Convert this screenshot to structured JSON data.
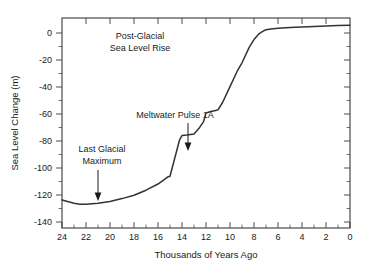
{
  "chart_data": {
    "type": "line",
    "title_line1": "Post-Glacial",
    "title_line2": "Sea Level Rise",
    "xlabel": "Thousands of Years Ago",
    "ylabel": "Sea Level Change (m)",
    "xlim": [
      24,
      0
    ],
    "ylim": [
      -145,
      5
    ],
    "x_ticks": [
      24,
      22,
      20,
      18,
      16,
      14,
      12,
      10,
      8,
      6,
      4,
      2,
      0
    ],
    "x_tick_labels": [
      "24",
      "22",
      "20",
      "18",
      "16",
      "14",
      "12",
      "10",
      "8",
      "6",
      "4",
      "2",
      "0"
    ],
    "y_ticks": [
      0,
      -20,
      -40,
      -60,
      -80,
      -100,
      -120,
      -140
    ],
    "y_tick_labels": [
      "0",
      "-20",
      "-40",
      "-60",
      "-80",
      "-100",
      "-120",
      "-140"
    ],
    "x_axis_reversed": true,
    "grid": false,
    "legend": "none",
    "line_color": "#333333",
    "series": [
      {
        "name": "Sea Level Change",
        "x": [
          24.0,
          23.0,
          22.5,
          22.0,
          21.0,
          20.0,
          19.0,
          18.0,
          17.0,
          16.0,
          15.2,
          15.0,
          14.6,
          14.2,
          14.0,
          13.6,
          13.0,
          12.6,
          12.2,
          12.0,
          11.6,
          11.2,
          11.0,
          10.6,
          10.0,
          9.4,
          9.0,
          8.4,
          8.0,
          7.6,
          7.2,
          7.0,
          6.6,
          6.0,
          5.0,
          4.0,
          3.0,
          2.0,
          1.0,
          0.0
        ],
        "y": [
          -125.0,
          -127.3,
          -128.0,
          -128.0,
          -127.4,
          -126.0,
          -124.0,
          -121.6,
          -118.0,
          -113.6,
          -108.6,
          -108.0,
          -95.0,
          -82.0,
          -79.0,
          -78.6,
          -77.8,
          -74.0,
          -69.0,
          -62.8,
          -61.8,
          -61.0,
          -60.6,
          -55.0,
          -44.0,
          -33.0,
          -27.0,
          -16.0,
          -10.4,
          -6.4,
          -4.2,
          -3.4,
          -2.8,
          -2.3,
          -1.8,
          -1.4,
          -1.0,
          -0.7,
          -0.4,
          -0.2
        ]
      }
    ],
    "annotations": [
      {
        "id": "last-glacial-maximum",
        "text_line1": "Last Glacial",
        "text_line2": "Maximum",
        "text": "Last Glacial Maximum",
        "points_to_x": 21.0,
        "points_to_y": -127.0
      },
      {
        "id": "meltwater-pulse-1a",
        "text_line1": "Meltwater Pulse 1A",
        "text": "Meltwater Pulse 1A",
        "points_to_x": 14.4,
        "points_to_y": -86.0
      }
    ]
  }
}
